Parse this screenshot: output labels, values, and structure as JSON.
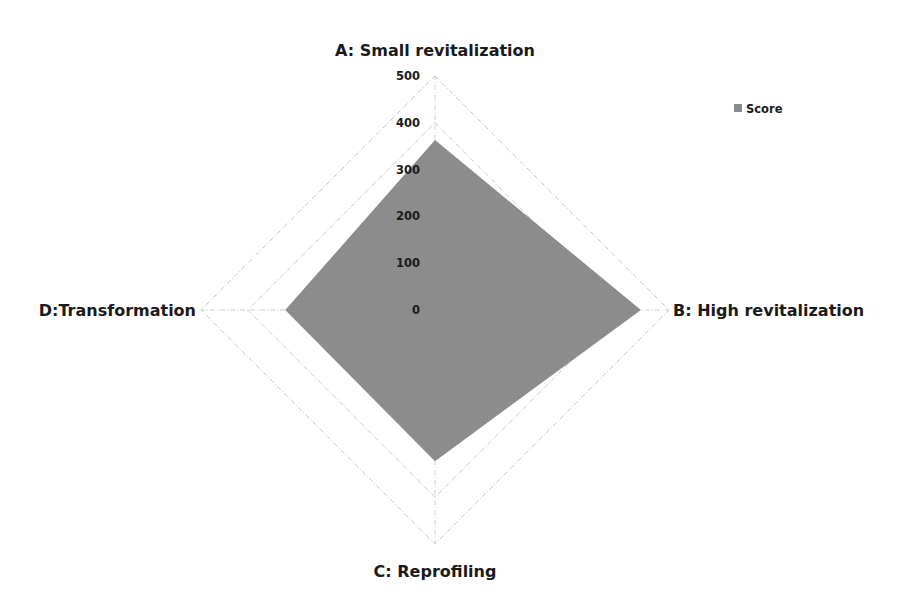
{
  "chart_data": {
    "type": "radar",
    "title": "",
    "categories": [
      "A: Small revitalization",
      "B: High revitalization",
      "C: Reprofiling",
      "D:Transformation"
    ],
    "series": [
      {
        "name": "Score",
        "values": [
          363,
          440,
          323,
          320
        ],
        "color": "#8c8c8c"
      }
    ],
    "radial_axis": {
      "min": 0,
      "max": 500,
      "ticks": [
        0,
        100,
        200,
        300,
        400,
        500
      ],
      "tick_labels": [
        "0",
        "100",
        "200",
        "300",
        "400",
        "500"
      ]
    },
    "grid": true,
    "legend": {
      "position": "top-right",
      "entries": [
        "Score"
      ]
    },
    "colors": {
      "grid": "#c8c8c8",
      "text": "#1a1a1a",
      "fill": "#8c8c8c"
    }
  }
}
